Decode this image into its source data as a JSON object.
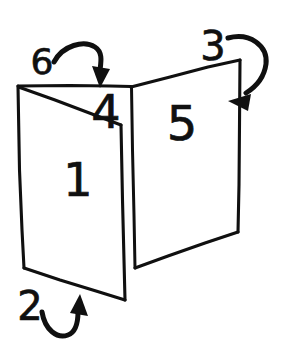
{
  "figure": {
    "style": {
      "ink_color": "#101010",
      "background_color": "#ffffff",
      "line_weight": "hand-drawn marker"
    }
  },
  "canvas": {
    "width": 288,
    "height": 355
  },
  "face_labels": [
    {
      "id": "face-1",
      "text": "1",
      "location": "left panel, lower area",
      "x": 78,
      "y": 196,
      "size": 46
    },
    {
      "id": "face-4",
      "text": "4",
      "location": "left panel, upper triangular flap near fold",
      "x": 93,
      "y": 128,
      "size": 46
    },
    {
      "id": "face-5",
      "text": "5",
      "location": "right panel, upper area",
      "x": 168,
      "y": 140,
      "size": 48
    }
  ],
  "arrow_labels": [
    {
      "id": "arrow-6",
      "text": "6",
      "location": "top left, above the fold",
      "x": 33,
      "y": 74,
      "size": 36,
      "direction": "arcs right and points down onto the top edge"
    },
    {
      "id": "arrow-3",
      "text": "3",
      "location": "top right, above the right panel",
      "x": 198,
      "y": 60,
      "size": 40,
      "direction": "arcs right then down, points left toward the right panel"
    },
    {
      "id": "arrow-2",
      "text": "2",
      "location": "bottom left, below the lower flap",
      "x": 17,
      "y": 320,
      "size": 40,
      "direction": "loops under and points up-right at the bottom edge"
    }
  ],
  "geometry": {
    "left_panel": {
      "name": "left-panel",
      "outline": "18,86 122,104 125,300 24,268",
      "diagonal_crease": "18,86 122,104"
    },
    "left_flap": {
      "name": "left-upper-flap",
      "outline": "18,86 125,86 122,104"
    },
    "fold_line": {
      "name": "center-fold",
      "path": "132,86 135,268"
    },
    "left_panel_inner_edge": {
      "name": "left-panel-inner-edge",
      "path": "122,104 125,300"
    },
    "right_panel": {
      "name": "right-panel",
      "outline": "132,86 240,60 238,232 135,268"
    },
    "bottom_flap_edge": {
      "name": "bottom-flap-edge",
      "path": "24,268 125,300"
    }
  }
}
